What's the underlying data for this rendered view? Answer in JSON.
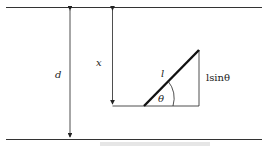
{
  "diagram": {
    "labels": {
      "d": "d",
      "x": "x",
      "l": "l",
      "theta": "θ",
      "lsin": "lsinθ"
    },
    "caption": ""
  }
}
